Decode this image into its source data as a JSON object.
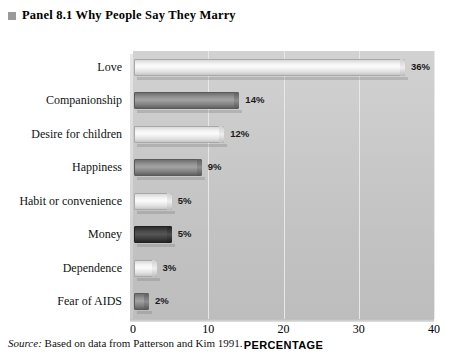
{
  "panel": {
    "bullet_icon": "square-bullet-icon",
    "label": "Panel 8.1",
    "title": "Why People Say They Marry",
    "full_title": "Panel 8.1  Why People Say They Marry"
  },
  "source": {
    "lead": "Source:",
    "text": " Based on data from Patterson and Kim 1991."
  },
  "colors": {
    "plot_background": "#c9c9c9",
    "bar_light": "#f2f2f2",
    "bar_mid": "#8a8a8a",
    "bar_dark": "#3a3a3a",
    "gridline": "#e8e8e8",
    "title_bullet": "#9a9a9a"
  },
  "chart_data": {
    "type": "bar",
    "orientation": "horizontal",
    "title": "Why People Say They Marry",
    "xlabel": "PERCENTAGE",
    "ylabel": "",
    "xlim": [
      0,
      40
    ],
    "xticks": [
      "0",
      "10",
      "20",
      "30",
      "40"
    ],
    "grid": true,
    "legend": "none",
    "categories": [
      "Love",
      "Companionship",
      "Desire for children",
      "Happiness",
      "Habit or convenience",
      "Money",
      "Dependence",
      "Fear of AIDS"
    ],
    "values": [
      36,
      14,
      12,
      9,
      5,
      5,
      3,
      2
    ],
    "value_labels": [
      "36%",
      "14%",
      "12%",
      "9%",
      "5%",
      "5%",
      "3%",
      "2%"
    ],
    "bar_shades": [
      "light",
      "mid",
      "light",
      "mid",
      "light",
      "dark",
      "light",
      "mid"
    ]
  }
}
